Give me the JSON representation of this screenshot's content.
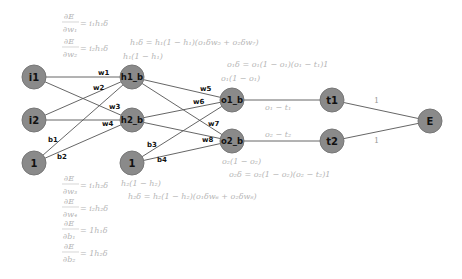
{
  "diagram": {
    "nodes": [
      {
        "id": "i1",
        "label": "i1"
      },
      {
        "id": "i2",
        "label": "i2"
      },
      {
        "id": "bias1",
        "label": "1"
      },
      {
        "id": "h1",
        "label": "h1_b"
      },
      {
        "id": "h2",
        "label": "h2_b"
      },
      {
        "id": "bias2",
        "label": "1"
      },
      {
        "id": "o1",
        "label": "o1_b"
      },
      {
        "id": "o2",
        "label": "o2_b"
      },
      {
        "id": "t1",
        "label": "t1"
      },
      {
        "id": "t2",
        "label": "t2"
      },
      {
        "id": "E",
        "label": "E"
      }
    ],
    "edge_labels": {
      "w1": "w1",
      "w2": "w2",
      "w3": "w3",
      "w4": "w4",
      "b1": "b1",
      "b2": "b2",
      "w5": "w5",
      "w6": "w6",
      "w7": "w7",
      "w8": "w8",
      "b3": "b3",
      "b4": "b4",
      "o1_t1": "o₁ − t₁",
      "o2_t2": "o₂ − t₂",
      "t1_E": "1",
      "t2_E": "1"
    },
    "formulas": {
      "dE_dw1": {
        "num": "∂E",
        "den": "∂w₁",
        "rhs": "= i₁h₁δ"
      },
      "dE_dw2": {
        "num": "∂E",
        "den": "∂w₂",
        "rhs": "= i₂h₁δ"
      },
      "dE_dw3": {
        "num": "∂E",
        "den": "∂w₃",
        "rhs": "= i₁h₂δ"
      },
      "dE_dw4": {
        "num": "∂E",
        "den": "∂w₄",
        "rhs": "= i₂h₂δ"
      },
      "dE_db1": {
        "num": "∂E",
        "den": "∂b₁",
        "rhs": "= 1h₁δ"
      },
      "dE_db2": {
        "num": "∂E",
        "den": "∂b₂",
        "rhs": "= 1h₂δ"
      },
      "h1_delta": "h₁δ = h₁(1 − h₁)(o₁δw₅ + o₂δw₇)",
      "h1_deriv": "h₁(1 − h₁)",
      "o1_delta": "o₁δ = o₁(1 − o₁)(o₁ − t₁)1",
      "o1_deriv": "o₁(1 − o₁)",
      "o2_deriv": "o₂(1 − o₂)",
      "o2_delta": "o₂δ = o₂(1 − o₂)(o₂ − t₂)1",
      "h2_deriv": "h₂(1 − h₂)",
      "h2_delta": "h₂δ = h₂(1 − h₂)(o₁δw₆ + o₂δw₈)"
    },
    "colors": {
      "node_fill": "#8a8a8a",
      "edge": "#555555",
      "formula_text": "#b5b5b5"
    }
  }
}
